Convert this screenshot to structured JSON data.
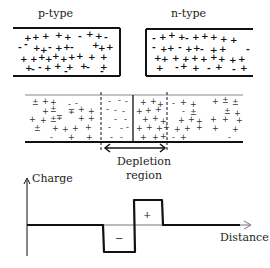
{
  "diagram": {
    "top": {
      "p_block": {
        "label": "p-type"
      },
      "n_block": {
        "label": "n-type"
      }
    },
    "junction": {
      "depletion_label_line1": "Depletion",
      "depletion_label_line2": "region"
    },
    "charge_plot": {
      "y_axis_label": "Charge",
      "x_axis_label": "Distance",
      "negative_region_sign": "−",
      "positive_region_sign": "+"
    }
  },
  "colors": {
    "ink": "#111111",
    "thin_line": "#888888",
    "background": "#ffffff"
  }
}
